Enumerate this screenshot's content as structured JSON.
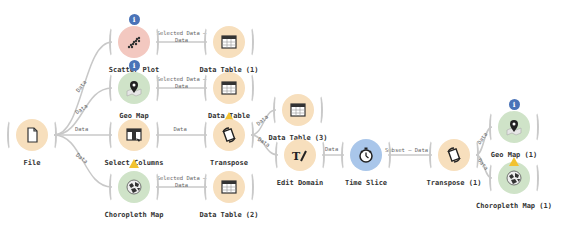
{
  "colors": {
    "data_orange": "#f7dfbd",
    "visual_red": "#f3c8c0",
    "geo_green": "#cfe3c8",
    "time_blue": "#a9c6ea",
    "link": "#c8c8c8",
    "info_badge": "#4a73b8",
    "warning_badge": "#f2c230"
  },
  "nodes": [
    {
      "id": "file",
      "label": "File",
      "icon": "file-icon",
      "category": "data"
    },
    {
      "id": "scatter",
      "label": "Scatter Plot",
      "icon": "scatter-plot-icon",
      "category": "visual",
      "status": "info"
    },
    {
      "id": "dt1",
      "label": "Data Table (1)",
      "icon": "table-icon",
      "category": "data"
    },
    {
      "id": "geomap",
      "label": "Geo Map",
      "icon": "map-pin-icon",
      "category": "geo",
      "status": "info"
    },
    {
      "id": "dt",
      "label": "Data Table",
      "icon": "table-icon",
      "category": "data",
      "status": "warning"
    },
    {
      "id": "selcols",
      "label": "Select Columns",
      "icon": "select-columns-icon",
      "category": "data",
      "status": "warning"
    },
    {
      "id": "transpose",
      "label": "Transpose",
      "icon": "transpose-icon",
      "category": "data"
    },
    {
      "id": "choro",
      "label": "Choropleth Map",
      "icon": "choropleth-icon",
      "category": "geo"
    },
    {
      "id": "dt2",
      "label": "Data Table (2)",
      "icon": "table-icon",
      "category": "data"
    },
    {
      "id": "dt3",
      "label": "Data Table (3)",
      "icon": "table-icon",
      "category": "data"
    },
    {
      "id": "editdomain",
      "label": "Edit Domain",
      "icon": "edit-domain-icon",
      "category": "data"
    },
    {
      "id": "timeslice",
      "label": "Time Slice",
      "icon": "stopwatch-icon",
      "category": "time"
    },
    {
      "id": "transpose1",
      "label": "Transpose (1)",
      "icon": "transpose-icon",
      "category": "data"
    },
    {
      "id": "geomap1",
      "label": "Geo Map (1)",
      "icon": "map-pin-icon",
      "category": "geo",
      "status": "info"
    },
    {
      "id": "choro1",
      "label": "Choropleth Map (1)",
      "icon": "choropleth-icon",
      "category": "geo",
      "status": "warning"
    }
  ],
  "links": [
    {
      "from": "file",
      "to": "scatter",
      "label": "Data"
    },
    {
      "from": "file",
      "to": "geomap",
      "label": "Data"
    },
    {
      "from": "file",
      "to": "selcols",
      "label": "Data"
    },
    {
      "from": "file",
      "to": "choro",
      "label": "Data"
    },
    {
      "from": "scatter",
      "to": "dt1",
      "label": "Selected Data — Data"
    },
    {
      "from": "geomap",
      "to": "dt",
      "label": "Selected Data — Data"
    },
    {
      "from": "selcols",
      "to": "transpose",
      "label": "Data"
    },
    {
      "from": "choro",
      "to": "dt2",
      "label": "Selected Data — Data"
    },
    {
      "from": "transpose",
      "to": "dt3",
      "label": "Data"
    },
    {
      "from": "transpose",
      "to": "editdomain",
      "label": "Data"
    },
    {
      "from": "editdomain",
      "to": "timeslice",
      "label": "Data"
    },
    {
      "from": "timeslice",
      "to": "transpose1",
      "label": "Subset — Data"
    },
    {
      "from": "transpose1",
      "to": "geomap1",
      "label": "Data"
    },
    {
      "from": "transpose1",
      "to": "choro1",
      "label": "Data"
    }
  ]
}
